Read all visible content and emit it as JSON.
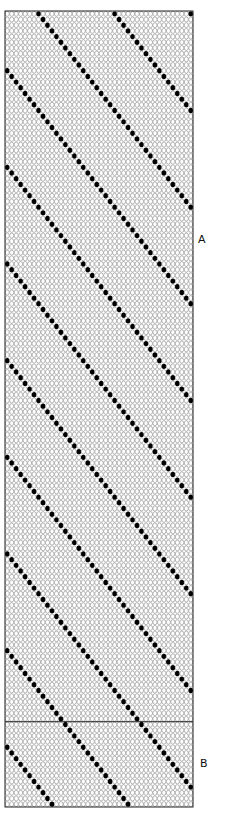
{
  "chart_data": {
    "type": "heatmap",
    "title": "",
    "grid": {
      "columns": 42,
      "rows": 140,
      "left": 5,
      "top": 11,
      "right": 193,
      "bottom": 807
    },
    "diagonal_period_columns": 17,
    "diagonal_offset": 7,
    "diagonal_direction": "down-right",
    "symbols": {
      "empty": "open-circle",
      "filled": "filled-dot"
    },
    "sections": [
      {
        "label": "A",
        "from_row": 0,
        "to_row": 125
      },
      {
        "label": "B",
        "from_row": 125,
        "to_row": 140
      }
    ],
    "divider_row": 125
  },
  "labels": {
    "section_a": "A",
    "section_b": "B"
  },
  "colors": {
    "grid_stroke": "#9a9a9a",
    "dot_fill": "#000000",
    "border": "#222222"
  }
}
